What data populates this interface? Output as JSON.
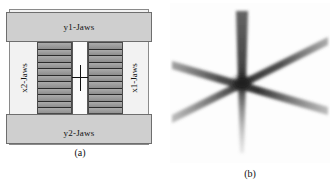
{
  "figure": {
    "panels": [
      {
        "id": "a",
        "caption": "(a)",
        "type": "schematic",
        "jaws": {
          "y1_label": "y1-Jaws",
          "y2_label": "y2-Jaws",
          "x1_label": "x1-Jaws",
          "x2_label": "x2-Jaws"
        },
        "slit": {
          "dimension_label": "1.0 cm",
          "leaf_rows": 11
        },
        "colors": {
          "background": "#f2f2f2",
          "jaw_fill": "#cfcfcf",
          "leaf_fill": "#9d9d9d",
          "slit_fill": "#fbfbfb",
          "outline": "#6e6e6e",
          "marker": "#111111"
        }
      },
      {
        "id": "b",
        "caption": "(b)",
        "type": "starshot-film",
        "colors": {
          "background": "#fdfdfd",
          "ray": "#3a3a3a",
          "hub": "#1a1a1a"
        }
      }
    ]
  },
  "chart_data": {
    "type": "scatter",
    "title": "",
    "xlabel": "",
    "ylabel": "",
    "panels": [
      {
        "id": "a",
        "label": "(a)",
        "description": "Collimator schematic: MLC leaf banks with a 1.0 cm central slit bounded by x1/x2 and y1/y2 jaws",
        "slit_width_cm": 1.0,
        "leaf_rows": 11,
        "labels": [
          "y1-Jaws",
          "y2-Jaws",
          "x1-Jaws",
          "x2-Jaws",
          "1.0 cm"
        ]
      },
      {
        "id": "b",
        "label": "(b)",
        "description": "Star-shot film exposure: three overlapping 1.0 cm slit strips crossing at a common isocenter",
        "strip_count": 3,
        "ray_count": 6,
        "center": {
          "x": 72,
          "y": 78
        },
        "ray_angles_deg": [
          90,
          270,
          20,
          200,
          160,
          340
        ]
      }
    ]
  }
}
